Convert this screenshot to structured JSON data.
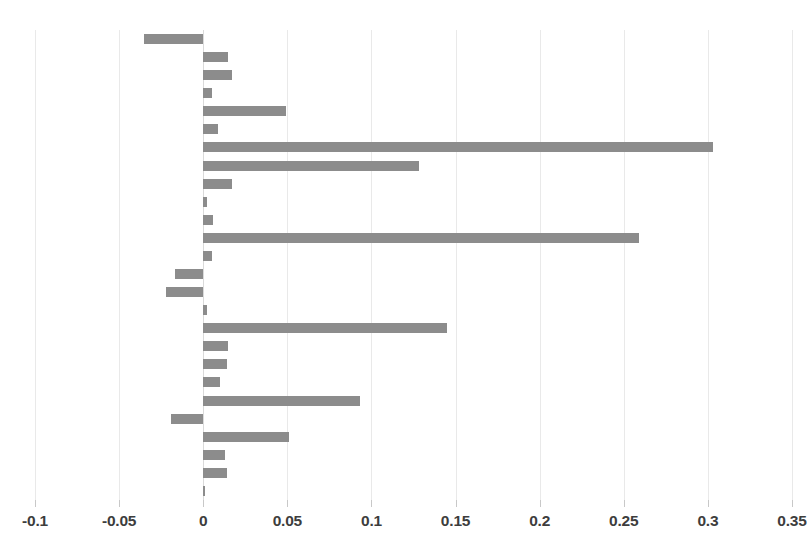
{
  "chart_data": {
    "type": "bar",
    "orientation": "horizontal",
    "title": "",
    "subtitle": "",
    "xlabel": "",
    "ylabel": "",
    "xlim": [
      -0.1,
      0.35
    ],
    "ylim": [
      0,
      26
    ],
    "grid": true,
    "legend": false,
    "legend_position": "none",
    "bar_color": "#8c8c8c",
    "background_color": "#ffffff",
    "gridline_color": "#e9e9e9",
    "axis_label_color": "#3d3d3d",
    "x_ticks": [
      -0.1,
      -0.05,
      0,
      0.05,
      0.1,
      0.15,
      0.2,
      0.25,
      0.3,
      0.35
    ],
    "x_tick_labels": [
      "-0.1",
      "-0.05",
      "0",
      "0.05",
      "0.1",
      "0.15",
      "0.2",
      "0.25",
      "0.3",
      "0.35"
    ],
    "y_tick_labels": [],
    "categories": [
      "1",
      "2",
      "3",
      "4",
      "5",
      "6",
      "7",
      "8",
      "9",
      "10",
      "11",
      "12",
      "13",
      "14",
      "15",
      "16",
      "17",
      "18",
      "19",
      "20",
      "21",
      "22",
      "23",
      "24",
      "25",
      "26"
    ],
    "values": [
      -0.035,
      0.015,
      0.017,
      0.005,
      0.049,
      0.009,
      0.303,
      0.128,
      0.017,
      0.002,
      0.006,
      0.259,
      0.005,
      -0.017,
      -0.022,
      0.002,
      0.145,
      0.015,
      0.014,
      0.01,
      0.093,
      -0.019,
      0.051,
      0.013,
      0.014,
      0.001
    ],
    "annotations": []
  }
}
